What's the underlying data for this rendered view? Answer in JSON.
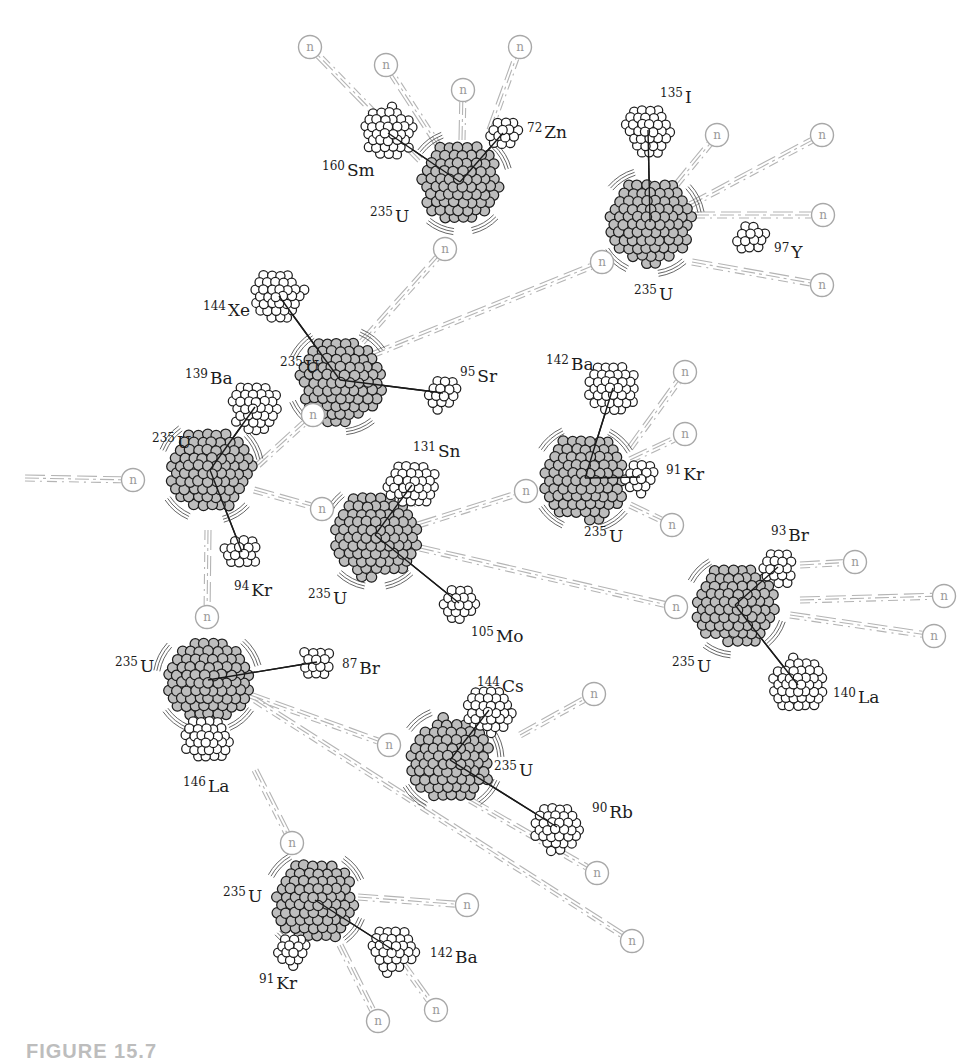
{
  "figure": {
    "caption_partial": "FIGURE 15.7",
    "neutron_label": "n",
    "colors": {
      "uranium_fill": "#bdbdbd",
      "fragment_fill": "#ffffff",
      "outline": "#1e1e1e",
      "neutron_stroke": "#a8a8a8",
      "trail_stroke": "#b4b4b4"
    }
  },
  "nuclei": [
    {
      "id": "u1",
      "isotope": "235",
      "symbol": "U",
      "x": 460,
      "y": 182,
      "r": 42,
      "label_x": 370,
      "label_y": 222
    },
    {
      "id": "u2",
      "isotope": "235",
      "symbol": "U",
      "x": 650,
      "y": 222,
      "r": 44,
      "label_x": 634,
      "label_y": 300
    },
    {
      "id": "u3",
      "isotope": "235",
      "symbol": "U",
      "x": 340,
      "y": 380,
      "r": 44,
      "label_x": 280,
      "label_y": 372
    },
    {
      "id": "u4",
      "isotope": "235",
      "symbol": "U",
      "x": 210,
      "y": 470,
      "r": 43,
      "label_x": 152,
      "label_y": 448
    },
    {
      "id": "u5",
      "isotope": "235",
      "symbol": "U",
      "x": 375,
      "y": 535,
      "r": 44,
      "label_x": 308,
      "label_y": 604
    },
    {
      "id": "u6",
      "isotope": "235",
      "symbol": "U",
      "x": 585,
      "y": 478,
      "r": 44,
      "label_x": 584,
      "label_y": 542
    },
    {
      "id": "u7",
      "isotope": "235",
      "symbol": "U",
      "x": 735,
      "y": 605,
      "r": 42,
      "label_x": 672,
      "label_y": 672
    },
    {
      "id": "u8",
      "isotope": "235",
      "symbol": "U",
      "x": 208,
      "y": 680,
      "r": 44,
      "label_x": 115,
      "label_y": 672
    },
    {
      "id": "u9",
      "isotope": "235",
      "symbol": "U",
      "x": 450,
      "y": 760,
      "r": 43,
      "label_x": 494,
      "label_y": 776
    },
    {
      "id": "u10",
      "isotope": "235",
      "symbol": "U",
      "x": 315,
      "y": 900,
      "r": 42,
      "label_x": 223,
      "label_y": 902
    }
  ],
  "fragments": [
    {
      "isotope": "160",
      "symbol": "Sm",
      "x": 388,
      "y": 133,
      "r": 27,
      "parent": "u1",
      "label_x": 322,
      "label_y": 176
    },
    {
      "isotope": "72",
      "symbol": "Zn",
      "x": 503,
      "y": 133,
      "r": 17,
      "parent": "u1",
      "label_x": 527,
      "label_y": 138
    },
    {
      "isotope": "135",
      "symbol": "I",
      "x": 648,
      "y": 130,
      "r": 26,
      "parent": "u2",
      "label_x": 660,
      "label_y": 103
    },
    {
      "isotope": "97",
      "symbol": "Y",
      "x": 751,
      "y": 237,
      "r": 17,
      "parent": null,
      "label_x": 774,
      "label_y": 258
    },
    {
      "isotope": "144",
      "symbol": "Xe",
      "x": 279,
      "y": 296,
      "r": 27,
      "parent": "u3",
      "label_x": 203,
      "label_y": 316
    },
    {
      "isotope": "95",
      "symbol": "Sr",
      "x": 443,
      "y": 393,
      "r": 18,
      "parent": "u3",
      "label_x": 460,
      "label_y": 382
    },
    {
      "isotope": "139",
      "symbol": "Ba",
      "x": 255,
      "y": 407,
      "r": 26,
      "parent": "u4",
      "label_x": 185,
      "label_y": 384
    },
    {
      "isotope": "94",
      "symbol": "Kr",
      "x": 242,
      "y": 552,
      "r": 18,
      "parent": "u4",
      "label_x": 234,
      "label_y": 596
    },
    {
      "isotope": "131",
      "symbol": "Sn",
      "x": 412,
      "y": 485,
      "r": 25,
      "parent": "u5",
      "label_x": 413,
      "label_y": 457
    },
    {
      "isotope": "105",
      "symbol": "Mo",
      "x": 459,
      "y": 603,
      "r": 19,
      "parent": "u5",
      "label_x": 471,
      "label_y": 642
    },
    {
      "isotope": "142",
      "symbol": "Ba",
      "x": 613,
      "y": 388,
      "r": 27,
      "parent": "u6",
      "label_x": 546,
      "label_y": 370
    },
    {
      "isotope": "91",
      "symbol": "Kr",
      "x": 640,
      "y": 477,
      "r": 18,
      "parent": "u6",
      "label_x": 666,
      "label_y": 480
    },
    {
      "isotope": "93",
      "symbol": "Br",
      "x": 778,
      "y": 567,
      "r": 19,
      "parent": "u7",
      "label_x": 771,
      "label_y": 541
    },
    {
      "isotope": "140",
      "symbol": "La",
      "x": 798,
      "y": 685,
      "r": 28,
      "parent": "u7",
      "label_x": 833,
      "label_y": 703
    },
    {
      "isotope": "87",
      "symbol": "Br",
      "x": 317,
      "y": 662,
      "r": 16,
      "parent": "u8",
      "label_x": 342,
      "label_y": 674
    },
    {
      "isotope": "146",
      "symbol": "La",
      "x": 207,
      "y": 740,
      "r": 25,
      "parent": null,
      "label_x": 183,
      "label_y": 792
    },
    {
      "isotope": "144",
      "symbol": "Cs",
      "x": 489,
      "y": 710,
      "r": 25,
      "parent": "u9",
      "label_x": 477,
      "label_y": 692
    },
    {
      "isotope": "90",
      "symbol": "Rb",
      "x": 557,
      "y": 827,
      "r": 25,
      "parent": "u9",
      "label_x": 592,
      "label_y": 818
    },
    {
      "isotope": "142",
      "symbol": "Ba",
      "x": 393,
      "y": 950,
      "r": 25,
      "parent": "u10",
      "label_x": 430,
      "label_y": 963
    },
    {
      "isotope": "91",
      "symbol": "Kr",
      "x": 292,
      "y": 950,
      "r": 18,
      "parent": null,
      "label_x": 259,
      "label_y": 989
    }
  ],
  "neutrons": [
    {
      "x": 310,
      "y": 47,
      "from_x": 420,
      "from_y": 160
    },
    {
      "x": 386,
      "y": 65,
      "from_x": 440,
      "from_y": 148
    },
    {
      "x": 463,
      "y": 90,
      "from_x": 462,
      "from_y": 140
    },
    {
      "x": 520,
      "y": 47,
      "from_x": 490,
      "from_y": 130
    },
    {
      "x": 717,
      "y": 135,
      "from_x": 676,
      "from_y": 185
    },
    {
      "x": 822,
      "y": 135,
      "from_x": 690,
      "from_y": 205
    },
    {
      "x": 823,
      "y": 215,
      "from_x": 695,
      "from_y": 215
    },
    {
      "x": 822,
      "y": 285,
      "from_x": 692,
      "from_y": 262
    },
    {
      "x": 602,
      "y": 262,
      "from_x": 372,
      "from_y": 355
    },
    {
      "x": 445,
      "y": 249,
      "from_x": 362,
      "from_y": 342
    },
    {
      "x": 313,
      "y": 415,
      "from_x": 258,
      "from_y": 465
    },
    {
      "x": 133,
      "y": 480,
      "from_x": 25,
      "from_y": 478
    },
    {
      "x": 322,
      "y": 509,
      "from_x": 254,
      "from_y": 490
    },
    {
      "x": 207,
      "y": 617,
      "from_x": 208,
      "from_y": 530
    },
    {
      "x": 685,
      "y": 372,
      "from_x": 630,
      "from_y": 448
    },
    {
      "x": 685,
      "y": 434,
      "from_x": 630,
      "from_y": 460
    },
    {
      "x": 672,
      "y": 525,
      "from_x": 630,
      "from_y": 505
    },
    {
      "x": 526,
      "y": 491,
      "from_x": 418,
      "from_y": 525
    },
    {
      "x": 676,
      "y": 607,
      "from_x": 420,
      "from_y": 548
    },
    {
      "x": 855,
      "y": 562,
      "from_x": 800,
      "from_y": 565
    },
    {
      "x": 944,
      "y": 596,
      "from_x": 800,
      "from_y": 600
    },
    {
      "x": 934,
      "y": 636,
      "from_x": 790,
      "from_y": 615
    },
    {
      "x": 389,
      "y": 745,
      "from_x": 250,
      "from_y": 695
    },
    {
      "x": 594,
      "y": 694,
      "from_x": 520,
      "from_y": 735
    },
    {
      "x": 597,
      "y": 873,
      "from_x": 470,
      "from_y": 800
    },
    {
      "x": 632,
      "y": 941,
      "from_x": 255,
      "from_y": 700
    },
    {
      "x": 292,
      "y": 843,
      "from_x": 255,
      "from_y": 770
    },
    {
      "x": 467,
      "y": 905,
      "from_x": 358,
      "from_y": 897
    },
    {
      "x": 436,
      "y": 1010,
      "from_x": 400,
      "from_y": 960
    },
    {
      "x": 378,
      "y": 1021,
      "from_x": 340,
      "from_y": 945
    }
  ]
}
